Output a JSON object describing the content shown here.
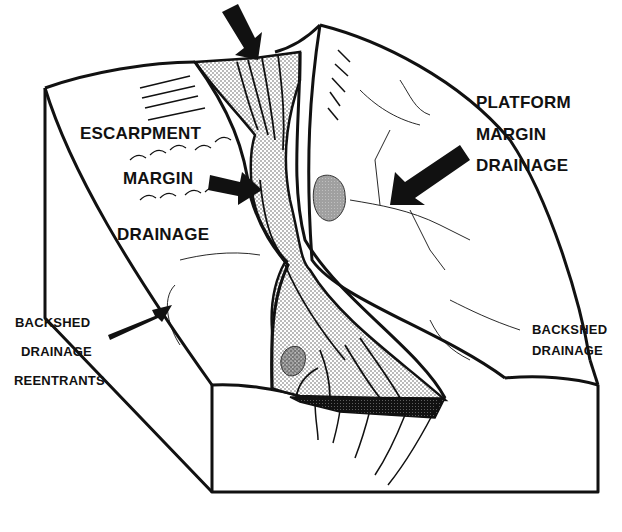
{
  "diagram": {
    "type": "block-diagram",
    "colors": {
      "line": "#111111",
      "background": "#ffffff",
      "stipple_light": "#d9d9d9",
      "stipple_dark": "#1a1a1a"
    },
    "labels": {
      "escarpment_margin_drainage": {
        "line1": "ESCARPMENT",
        "line2": "MARGIN",
        "line3": "DRAINAGE"
      },
      "platform_margin_drainage": {
        "line1": "PLATFORM",
        "line2": "MARGIN",
        "line3": "DRAINAGE"
      },
      "backshed_drainage_reentrants": {
        "line1": "BACKSHED",
        "line2": "DRAINAGE",
        "line3": "REENTRANTS"
      },
      "backshed_drainage": {
        "line1": "BACKSHED",
        "line2": "DRAINAGE"
      }
    },
    "arrows": [
      {
        "name": "canyon-head-arrow",
        "points_to": "canyon head"
      },
      {
        "name": "escarpment-margin-arrow",
        "points_to": "canyon wall"
      },
      {
        "name": "platform-margin-arrow",
        "points_to": "platform margin gullies"
      },
      {
        "name": "backshed-reentrant-arrow",
        "points_to": "backshed reentrant"
      }
    ]
  }
}
